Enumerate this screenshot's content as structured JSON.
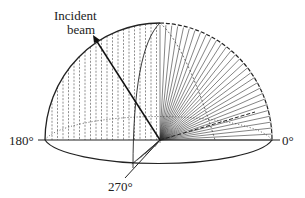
{
  "diagram": {
    "labels": {
      "incident_line1": "Incident",
      "incident_line2": "beam",
      "angle_180": "180°",
      "angle_0": "0°",
      "angle_270": "270°"
    },
    "colors": {
      "stroke": "#222222",
      "background": "#ffffff"
    }
  }
}
